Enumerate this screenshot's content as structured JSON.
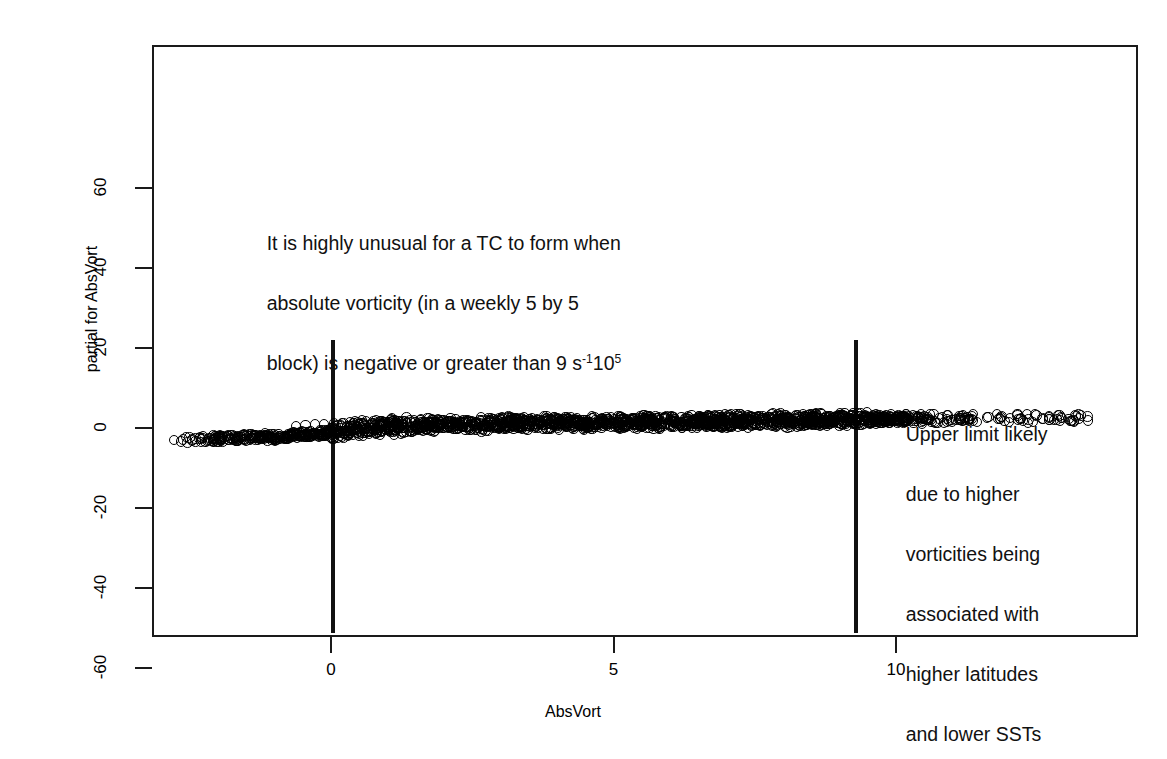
{
  "chart_data": {
    "type": "scatter",
    "title": "",
    "xlabel": "AbsVort",
    "ylabel": "partial for AbsVort",
    "xlim": [
      -2.9,
      13.6
    ],
    "ylim": [
      -68,
      70
    ],
    "xticks": [
      0,
      5,
      10
    ],
    "xtick_labels": [
      "0",
      "5",
      "10"
    ],
    "yticks": [
      -60,
      -40,
      -20,
      0,
      20,
      40,
      60
    ],
    "ytick_labels": [
      "-60",
      "-40",
      "-20",
      "0",
      "20",
      "40",
      "60"
    ],
    "grid": false,
    "legend": null,
    "marker": "open-circle",
    "series": [
      {
        "name": "partial for AbsVort",
        "points": [
          [
            -2.75,
            -2.9
          ],
          [
            -2.55,
            -2.85
          ],
          [
            -2.35,
            -2.8
          ],
          [
            -2.2,
            -2.75
          ],
          [
            -2.05,
            -2.7
          ],
          [
            -1.9,
            -2.6
          ],
          [
            -1.75,
            -2.55
          ],
          [
            -1.6,
            -2.5
          ],
          [
            -1.45,
            -2.45
          ],
          [
            -1.3,
            -2.4
          ],
          [
            -1.15,
            -2.3
          ],
          [
            -1.0,
            -2.2
          ],
          [
            -0.85,
            -2.1
          ],
          [
            -0.7,
            -1.95
          ],
          [
            -0.55,
            -1.8
          ],
          [
            -0.4,
            -1.6
          ],
          [
            -0.25,
            -1.35
          ],
          [
            -0.1,
            -1.1
          ],
          [
            0.05,
            -0.85
          ],
          [
            0.2,
            -0.6
          ],
          [
            0.35,
            -0.4
          ],
          [
            0.5,
            -0.2
          ],
          [
            0.65,
            0.0
          ],
          [
            0.8,
            0.15
          ],
          [
            0.95,
            0.3
          ],
          [
            1.1,
            0.4
          ],
          [
            1.25,
            0.5
          ],
          [
            1.4,
            0.6
          ],
          [
            1.55,
            0.65
          ],
          [
            1.7,
            0.7
          ],
          [
            1.85,
            0.75
          ],
          [
            2.0,
            0.8
          ],
          [
            2.2,
            0.85
          ],
          [
            2.4,
            0.9
          ],
          [
            2.6,
            0.95
          ],
          [
            2.8,
            1.0
          ],
          [
            3.0,
            1.05
          ],
          [
            3.2,
            1.1
          ],
          [
            3.4,
            1.1
          ],
          [
            3.6,
            1.15
          ],
          [
            3.8,
            1.2
          ],
          [
            4.0,
            1.2
          ],
          [
            4.2,
            1.25
          ],
          [
            4.4,
            1.3
          ],
          [
            4.6,
            1.3
          ],
          [
            4.8,
            1.35
          ],
          [
            5.0,
            1.4
          ],
          [
            5.2,
            1.4
          ],
          [
            5.4,
            1.45
          ],
          [
            5.6,
            1.5
          ],
          [
            5.8,
            1.5
          ],
          [
            6.0,
            1.55
          ],
          [
            6.2,
            1.6
          ],
          [
            6.4,
            1.6
          ],
          [
            6.6,
            1.65
          ],
          [
            6.8,
            1.7
          ],
          [
            7.0,
            1.7
          ],
          [
            7.2,
            1.75
          ],
          [
            7.4,
            1.8
          ],
          [
            7.6,
            1.8
          ],
          [
            7.8,
            1.85
          ],
          [
            8.0,
            1.9
          ],
          [
            8.2,
            1.9
          ],
          [
            8.4,
            1.95
          ],
          [
            8.6,
            2.0
          ],
          [
            8.8,
            2.0
          ],
          [
            9.0,
            2.05
          ],
          [
            9.2,
            2.1
          ],
          [
            9.4,
            2.1
          ],
          [
            9.6,
            2.15
          ],
          [
            9.8,
            2.2
          ],
          [
            10.0,
            2.2
          ],
          [
            10.3,
            2.3
          ],
          [
            10.6,
            2.3
          ],
          [
            10.9,
            2.35
          ],
          [
            11.2,
            2.4
          ],
          [
            11.5,
            2.4
          ],
          [
            11.8,
            2.45
          ],
          [
            12.1,
            2.5
          ],
          [
            12.5,
            2.5
          ],
          [
            13.0,
            2.5
          ],
          [
            13.4,
            2.55
          ]
        ]
      }
    ],
    "reference_lines": [
      {
        "name": "lower-threshold",
        "orientation": "vertical",
        "x": 0.0,
        "color": "#111111"
      },
      {
        "name": "upper-threshold",
        "orientation": "vertical",
        "x": 9.25,
        "color": "#111111"
      }
    ],
    "annotations": [
      {
        "id": "annotation-left",
        "text": "It is highly unusual for a TC to form when absolute vorticity (in a weekly 5 by 5 block) is negative or greater than 9 s",
        "sup1": "-1",
        "text_after_sup1": "10",
        "sup2": "5",
        "x": 0.5,
        "y": 21
      },
      {
        "id": "annotation-right",
        "text": "Upper limit likely due to higher vorticities being associated with higher latitudes and lower SSTs",
        "x": 10.0,
        "y": -17
      }
    ]
  },
  "axes": {
    "x": {
      "label": "AbsVort",
      "ticks": [
        {
          "value": 0,
          "label": "0"
        },
        {
          "value": 5,
          "label": "5"
        },
        {
          "value": 10,
          "label": "10"
        }
      ]
    },
    "y": {
      "label": "partial for AbsVort",
      "ticks": [
        {
          "value": 60,
          "label": "60"
        },
        {
          "value": 40,
          "label": "40"
        },
        {
          "value": 20,
          "label": "20"
        },
        {
          "value": 0,
          "label": "0"
        },
        {
          "value": -20,
          "label": "-20"
        },
        {
          "value": -40,
          "label": "-40"
        },
        {
          "value": -60,
          "label": "-60"
        }
      ]
    }
  },
  "annotation_left": {
    "line1": "It is highly unusual for a TC to form when",
    "line2": "absolute vorticity (in a weekly 5 by 5",
    "line3_a": "block) is negative or greater than 9 s",
    "line3_sup1": "-1",
    "line3_b": "10",
    "line3_sup2": "5"
  },
  "annotation_right": {
    "line1": "Upper limit likely",
    "line2": "due to higher",
    "line3": "vorticities being",
    "line4": "associated with",
    "line5": "higher latitudes",
    "line6": "and lower SSTs"
  },
  "colors": {
    "axis": "#1a1a1a",
    "marker": "#000000",
    "reference_line": "#111111",
    "background": "#ffffff"
  }
}
